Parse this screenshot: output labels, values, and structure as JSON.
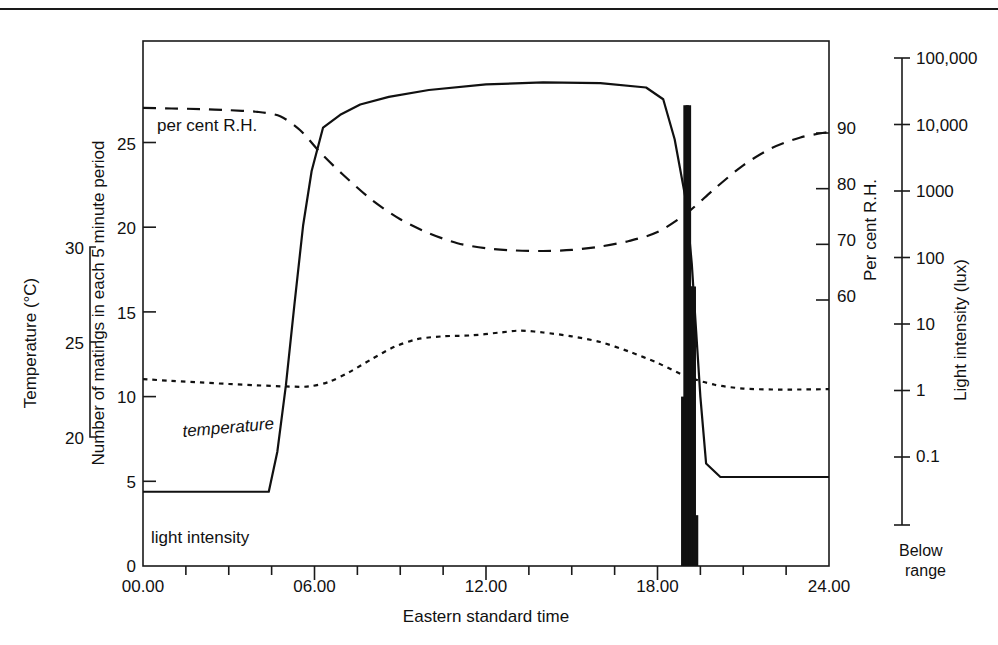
{
  "figure": {
    "top_rule": true
  },
  "axes": {
    "x": {
      "title": "Eastern standard time",
      "ticks": [
        "00.00",
        "06.00",
        "12.00",
        "18.00",
        "24.00"
      ],
      "tick_values": [
        0,
        6,
        12,
        18,
        24
      ],
      "minor_interval_hours": 1.5,
      "range": [
        0,
        24
      ]
    },
    "matings": {
      "title": "Number of matings in each 5 minute period",
      "ticks": [
        "0",
        "5",
        "10",
        "15",
        "20",
        "25"
      ],
      "tick_values": [
        0,
        5,
        10,
        15,
        20,
        25
      ],
      "range": [
        0,
        31
      ]
    },
    "temperature": {
      "title": "Temperature (°C)",
      "ticks": [
        "20",
        "25",
        "30"
      ],
      "tick_values": [
        20,
        25,
        30
      ],
      "range": [
        20,
        30
      ],
      "unit": "°C"
    },
    "humidity": {
      "title": "Per cent R.H.",
      "ticks": [
        "60",
        "70",
        "80",
        "90"
      ],
      "tick_values": [
        60,
        70,
        80,
        90
      ],
      "range": [
        55,
        95
      ]
    },
    "light": {
      "title": "Light intensity (lux)",
      "ticks": [
        "0.1",
        "1",
        "10",
        "100",
        "1000",
        "10,000",
        "100,000"
      ],
      "tick_values": [
        0.1,
        1,
        10,
        100,
        1000,
        10000,
        100000
      ],
      "scale": "log",
      "below_range_label_line1": "Below",
      "below_range_label_line2": "range"
    }
  },
  "series_labels": {
    "humidity": "per cent R.H.",
    "temperature": "temperature",
    "light": "light intensity"
  },
  "chart_data": {
    "type": "line",
    "title": "",
    "xlabel": "Eastern standard time",
    "ylabel": "Number of matings in each 5 minute period",
    "xlim": [
      0,
      24
    ],
    "grid": false,
    "legend": "inline-labels",
    "series": [
      {
        "name": "light intensity",
        "style": "solid",
        "axis": "light",
        "unit": "lux",
        "x": [
          0.0,
          4.4,
          4.7,
          5.0,
          5.3,
          5.6,
          5.9,
          6.3,
          6.9,
          7.6,
          8.6,
          10.0,
          12.0,
          14.0,
          16.0,
          17.6,
          18.2,
          18.6,
          19.0,
          19.2,
          19.35,
          19.5,
          19.7,
          20.2,
          21.0,
          24.0
        ],
        "y": [
          0.03,
          0.03,
          0.12,
          1.2,
          20,
          300,
          2000,
          9000,
          14000,
          20000,
          26000,
          33000,
          40000,
          43000,
          42000,
          36000,
          24000,
          6000,
          700,
          80,
          8,
          0.8,
          0.08,
          0.05,
          0.05,
          0.05
        ]
      },
      {
        "name": "per cent R.H.",
        "style": "dashed",
        "axis": "humidity",
        "unit": "%",
        "x": [
          0.0,
          1.0,
          2.0,
          3.0,
          4.0,
          4.8,
          5.5,
          6.2,
          7.0,
          8.0,
          9.0,
          10.0,
          11.0,
          12.0,
          13.0,
          14.0,
          15.0,
          16.0,
          17.0,
          18.0,
          19.0,
          20.0,
          21.0,
          22.0,
          23.0,
          24.0
        ],
        "y": [
          94.5,
          94.4,
          94.3,
          94.1,
          93.8,
          93.0,
          90.5,
          86.5,
          82.5,
          78.0,
          74.5,
          72.0,
          70.2,
          69.3,
          68.9,
          68.8,
          69.0,
          69.6,
          70.6,
          72.2,
          75.5,
          80.0,
          84.2,
          87.3,
          89.2,
          90.2
        ]
      },
      {
        "name": "temperature",
        "style": "dotted",
        "axis": "temperature",
        "unit": "°C",
        "x": [
          0.0,
          1.0,
          2.0,
          3.0,
          4.0,
          5.0,
          5.8,
          6.5,
          7.2,
          8.0,
          8.8,
          9.6,
          10.5,
          11.5,
          12.5,
          13.2,
          14.0,
          15.0,
          16.0,
          17.0,
          18.0,
          19.0,
          20.0,
          21.0,
          22.0,
          23.0,
          24.0
        ],
        "y": [
          23.05,
          22.95,
          22.87,
          22.79,
          22.72,
          22.66,
          22.66,
          22.9,
          23.4,
          24.1,
          24.75,
          25.15,
          25.3,
          25.35,
          25.5,
          25.6,
          25.5,
          25.3,
          25.0,
          24.5,
          23.9,
          23.2,
          22.75,
          22.55,
          22.5,
          22.5,
          22.52
        ]
      }
    ],
    "bars": {
      "name": "matings",
      "axis": "matings",
      "bar_width_hours": 0.083,
      "x": [
        18.92,
        19.0,
        19.08,
        19.17,
        19.25,
        19.33
      ],
      "values": [
        10,
        27.2,
        27.2,
        16.5,
        16.5,
        3.0
      ]
    }
  }
}
